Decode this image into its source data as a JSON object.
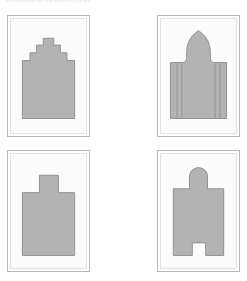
{
  "figure": {
    "caption_fragment": "architectural elevation plates",
    "background_color": "#ffffff",
    "panel_border_color": "#b9b9b9",
    "panel_inner_border_color": "#e2e2e2",
    "panel_fill_color": "#fbfbfb",
    "shape_fill_color": "#b3b3b3",
    "shape_stroke_color": "#8f8f8f",
    "detail_line_color": "#8f8f8f",
    "layout": "2x2 grid of framed plates"
  },
  "panels": [
    {
      "id": "panel-top-left",
      "position": "top-left",
      "shape_name": "stepped-gable-facade",
      "description": "Crow-stepped gable elevation with three symmetric steps rising to a central crown",
      "steps_per_side": 3,
      "has_interior_detail": false
    },
    {
      "id": "panel-top-right",
      "position": "top-right",
      "shape_name": "ogee-dome-facade",
      "description": "Onion / ogee domed elevation flanked by lower side wings with vertical pilaster lines",
      "steps_per_side": 0,
      "has_interior_detail": true,
      "pilaster_lines": 4
    },
    {
      "id": "panel-bottom-left",
      "position": "bottom-left",
      "shape_name": "flat-block-with-central-tower",
      "description": "Rectangular block elevation with a raised flat-topped central tower",
      "steps_per_side": 0,
      "has_interior_detail": false
    },
    {
      "id": "panel-bottom-right",
      "position": "bottom-right",
      "shape_name": "cruciform-arched-tower",
      "description": "Cross-shaped plan with an arched central tower above and a doorway notch cut into the base",
      "steps_per_side": 0,
      "has_interior_detail": false,
      "has_door_notch": true
    }
  ]
}
